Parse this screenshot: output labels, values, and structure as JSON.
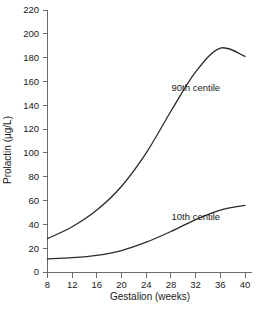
{
  "chart_data": {
    "type": "line",
    "title": "",
    "xlabel": "Gestalion (weeks)",
    "ylabel": "Prolactin (µg/L)",
    "xlim": [
      8,
      40
    ],
    "ylim": [
      0,
      220
    ],
    "xticks": [
      8,
      12,
      16,
      20,
      24,
      28,
      32,
      36,
      40
    ],
    "yticks": [
      0,
      20,
      40,
      60,
      80,
      100,
      120,
      140,
      160,
      180,
      200,
      220
    ],
    "grid": false,
    "legend_position": "inline-annotation",
    "line_color": "#2b2b2b",
    "axis_color": "#6b6b6b",
    "background_color": "#ffffff",
    "x": [
      8,
      12,
      16,
      20,
      24,
      28,
      32,
      36,
      40
    ],
    "series": [
      {
        "name": "90th centile",
        "label": "90th centile",
        "values": [
          28,
          38,
          52,
          72,
          100,
          135,
          168,
          188,
          181
        ]
      },
      {
        "name": "10th centile",
        "label": "10th centile",
        "values": [
          11,
          12,
          14,
          18,
          25,
          34,
          44,
          52,
          56
        ]
      }
    ],
    "annotations": [
      {
        "text": "90th centile",
        "x": 36.2,
        "y": 152
      },
      {
        "text": "10th centile",
        "x": 36.2,
        "y": 44
      }
    ]
  }
}
